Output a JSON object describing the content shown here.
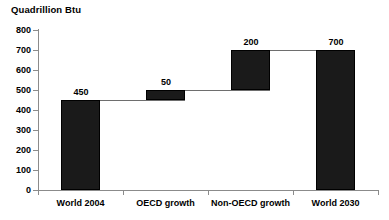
{
  "chart_data": {
    "type": "bar",
    "subtype": "waterfall",
    "title": "Quadrillion Btu",
    "xlabel": "",
    "ylabel": "Quadrillion Btu",
    "categories": [
      "World 2004",
      "OECD growth",
      "Non-OECD growth",
      "World 2030"
    ],
    "values": [
      450,
      50,
      200,
      700
    ],
    "labels": [
      "450",
      "50",
      "200",
      "700"
    ],
    "bar_bases": [
      0,
      450,
      500,
      0
    ],
    "bar_tops": [
      450,
      500,
      700,
      700
    ],
    "bar_kinds": [
      "total",
      "delta",
      "delta",
      "total"
    ],
    "ylim": [
      0,
      800
    ],
    "y_ticks": [
      0,
      100,
      200,
      300,
      400,
      500,
      600,
      700,
      800
    ],
    "y_tick_labels": [
      "0",
      "100",
      "200",
      "300",
      "400",
      "500",
      "600",
      "700",
      "800"
    ],
    "grid": false,
    "legend": false,
    "legend_position": "none",
    "bar_color": "#1a1a1a",
    "axis_color": "#8b8b8b",
    "connector_color": "#6e6e6e",
    "background_color": "#ffffff",
    "connectors": [
      {
        "from_category": "World 2004",
        "to_category": "OECD growth",
        "value": 450
      },
      {
        "from_category": "OECD growth",
        "to_category": "Non-OECD growth",
        "value": 500
      },
      {
        "from_category": "Non-OECD growth",
        "to_category": "World 2030",
        "value": 700
      }
    ]
  }
}
